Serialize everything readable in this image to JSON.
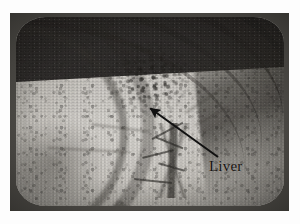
{
  "figure": {
    "kind": "halftone-photograph-of-crt-display",
    "background_color": "#ffffff",
    "photo": {
      "left": 10,
      "top": 13,
      "width": 279,
      "height": 198,
      "bezel_color": "#2a2926",
      "screen_color": "#c9c7c2"
    }
  },
  "annotations": {
    "items": [
      {
        "type": "arrow-with-label",
        "label": "Liver",
        "label_color": "#15120f",
        "arrow_color": "#111111",
        "tail_x": 218,
        "tail_y": 157,
        "tip_x": 148,
        "tip_y": 107
      }
    ]
  },
  "label": {
    "liver": "Liver"
  }
}
